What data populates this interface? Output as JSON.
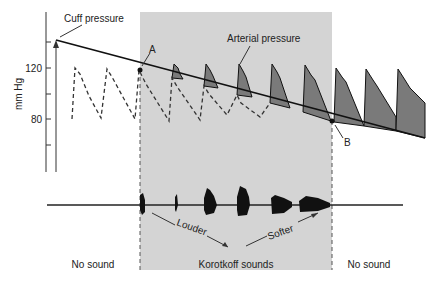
{
  "axis": {
    "ylabel": "mm Hg",
    "ticks": [
      "120",
      "80"
    ]
  },
  "labels": {
    "cuff_pressure": "Cuff pressure",
    "arterial_pressure": "Arterial pressure",
    "point_a": "A",
    "point_b": "B",
    "louder": "Louder",
    "softer": "Softer",
    "no_sound_left": "No sound",
    "korotkoff": "Korotkoff sounds",
    "no_sound_right": "No sound"
  },
  "colors": {
    "shade": "#d4d4d4",
    "fill": "#7a7a7a",
    "line": "#111111"
  }
}
